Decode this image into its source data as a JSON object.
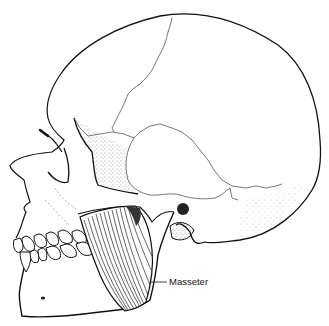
{
  "figure": {
    "labels": [
      {
        "text": "Masseter",
        "target": "masseter-muscle"
      }
    ]
  },
  "colors": {
    "background": "#ffffff",
    "ink": "#111111",
    "suture": "#555555",
    "stipple": "#444444"
  }
}
